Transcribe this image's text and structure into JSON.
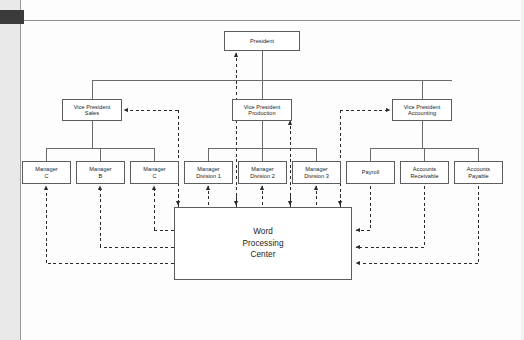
{
  "page": {
    "kind": "scanned-textbook-page",
    "has_corner_tab": true,
    "has_left_margin_strip": true
  },
  "diagram": {
    "type": "org-chart",
    "colors": {
      "box_border": "#5d5d5d",
      "solid_line": "#6a6a6a",
      "dashed_line": "#2a2a2a",
      "text": "#1a1a1a",
      "page_background": "#fdfdfd",
      "margin_strip": "#e9e9e9",
      "corner_tab": "#3b3b3b"
    },
    "legend": {
      "solid": "reporting / line authority",
      "dashed": "work flow to and from Word Processing Center"
    },
    "levels": [
      {
        "level": 1,
        "nodes": [
          {
            "id": "president",
            "label": "President",
            "x": 224,
            "y": 31,
            "w": 76,
            "h": 20
          }
        ]
      },
      {
        "level": 2,
        "nodes": [
          {
            "id": "vp-sales",
            "label": "Vice President\nSales",
            "x": 62,
            "y": 99,
            "w": 60,
            "h": 22
          },
          {
            "id": "vp-production",
            "label": "Vice President\nProduction",
            "x": 232,
            "y": 99,
            "w": 60,
            "h": 22
          },
          {
            "id": "vp-accounting",
            "label": "Vice President\nAccounting",
            "x": 392,
            "y": 99,
            "w": 60,
            "h": 22
          }
        ]
      },
      {
        "level": 3,
        "nodes": [
          {
            "id": "mgr-a",
            "label": "Manager\nC",
            "x": 22,
            "y": 161,
            "w": 49,
            "h": 23
          },
          {
            "id": "mgr-b",
            "label": "Manager\nB",
            "x": 76,
            "y": 161,
            "w": 49,
            "h": 23
          },
          {
            "id": "mgr-c",
            "label": "Manager\nC",
            "x": 130,
            "y": 161,
            "w": 49,
            "h": 23
          },
          {
            "id": "mgr-div-1",
            "label": "Manager\nDivision 1",
            "x": 184,
            "y": 161,
            "w": 49,
            "h": 23
          },
          {
            "id": "mgr-div-2",
            "label": "Manager\nDivision 2",
            "x": 238,
            "y": 161,
            "w": 49,
            "h": 23
          },
          {
            "id": "mgr-div-3",
            "label": "Manager\nDivision 3",
            "x": 292,
            "y": 161,
            "w": 49,
            "h": 23
          },
          {
            "id": "payroll",
            "label": "Payroll",
            "x": 346,
            "y": 161,
            "w": 49,
            "h": 23
          },
          {
            "id": "accounts-receivable",
            "label": "Accounts\nReceivable",
            "x": 400,
            "y": 161,
            "w": 49,
            "h": 23
          },
          {
            "id": "accounts-payable",
            "label": "Accounts\nPayable",
            "x": 454,
            "y": 161,
            "w": 49,
            "h": 23
          }
        ]
      },
      {
        "level": 4,
        "nodes": [
          {
            "id": "word-processing-center",
            "label": "Word\nProcessing\nCenter",
            "x": 174,
            "y": 207,
            "w": 178,
            "h": 73
          }
        ]
      }
    ]
  }
}
